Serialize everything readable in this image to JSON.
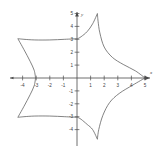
{
  "figure": {
    "title": "",
    "background_color": "#ffffff",
    "axis_color": "#4a4a4a",
    "curve_color": "#5a5a5a",
    "width": 158,
    "height": 155
  },
  "axes": {
    "x_axis_label": "x",
    "y_axis_label": "y",
    "x_ticks": [
      {
        "value": -4,
        "label": "-4"
      },
      {
        "value": -3,
        "label": "-3"
      },
      {
        "value": -2,
        "label": "-2"
      },
      {
        "value": -1,
        "label": "-1"
      },
      {
        "value": 1,
        "label": "1"
      },
      {
        "value": 2,
        "label": "2"
      },
      {
        "value": 3,
        "label": "3"
      },
      {
        "value": 4,
        "label": "4"
      },
      {
        "value": 5,
        "label": "5"
      }
    ],
    "y_ticks": [
      {
        "value": 5,
        "label": "5"
      },
      {
        "value": 4,
        "label": "4"
      },
      {
        "value": 3,
        "label": "3"
      },
      {
        "value": 2,
        "label": "2"
      },
      {
        "value": 1,
        "label": "1"
      },
      {
        "value": -1,
        "label": "-1"
      },
      {
        "value": -2,
        "label": "-2"
      },
      {
        "value": -3,
        "label": "-3"
      },
      {
        "value": -4,
        "label": "-4"
      }
    ]
  },
  "chart_data": {
    "type": "line",
    "title": "",
    "xlabel": "x",
    "ylabel": "y",
    "xlim": [
      -5.2,
      5.4
    ],
    "ylim": [
      -5.0,
      5.4
    ],
    "grid": false,
    "legend": null,
    "series": [
      {
        "name": "hypocycloid",
        "closed": true,
        "outer_cusps": [
          {
            "x": 5.0,
            "y": 0.0
          },
          {
            "x": 1.5,
            "y": 5.0
          },
          {
            "x": -4.35,
            "y": 3.05
          },
          {
            "x": -4.35,
            "y": -3.05
          },
          {
            "x": 1.5,
            "y": -4.75
          }
        ],
        "inner_cusps": [
          {
            "x": 0.05,
            "y": 3.05
          },
          {
            "x": -3.05,
            "y": 0.0
          },
          {
            "x": 0.05,
            "y": -3.05
          }
        ],
        "points": [
          {
            "x": 5.0,
            "y": 0.0
          },
          {
            "x": 4.3,
            "y": 0.55
          },
          {
            "x": 3.4,
            "y": 1.05
          },
          {
            "x": 2.6,
            "y": 1.6
          },
          {
            "x": 2.0,
            "y": 2.4
          },
          {
            "x": 1.68,
            "y": 3.5
          },
          {
            "x": 1.55,
            "y": 4.4
          },
          {
            "x": 1.5,
            "y": 5.0
          },
          {
            "x": 1.15,
            "y": 4.2
          },
          {
            "x": 0.75,
            "y": 3.6
          },
          {
            "x": 0.3,
            "y": 3.2
          },
          {
            "x": 0.05,
            "y": 3.05
          },
          {
            "x": -0.9,
            "y": 3.0
          },
          {
            "x": -2.0,
            "y": 2.95
          },
          {
            "x": -3.1,
            "y": 2.95
          },
          {
            "x": -3.9,
            "y": 3.0
          },
          {
            "x": -4.35,
            "y": 3.05
          },
          {
            "x": -3.9,
            "y": 2.2
          },
          {
            "x": -3.45,
            "y": 1.3
          },
          {
            "x": -3.15,
            "y": 0.6
          },
          {
            "x": -3.05,
            "y": 0.0
          },
          {
            "x": -3.15,
            "y": -0.6
          },
          {
            "x": -3.45,
            "y": -1.3
          },
          {
            "x": -3.9,
            "y": -2.2
          },
          {
            "x": -4.35,
            "y": -3.05
          },
          {
            "x": -3.9,
            "y": -3.0
          },
          {
            "x": -3.1,
            "y": -2.95
          },
          {
            "x": -2.0,
            "y": -2.95
          },
          {
            "x": -0.9,
            "y": -3.0
          },
          {
            "x": 0.05,
            "y": -3.05
          },
          {
            "x": 0.3,
            "y": -3.2
          },
          {
            "x": 0.75,
            "y": -3.6
          },
          {
            "x": 1.15,
            "y": -4.0
          },
          {
            "x": 1.5,
            "y": -4.75
          },
          {
            "x": 1.6,
            "y": -4.0
          },
          {
            "x": 1.9,
            "y": -2.9
          },
          {
            "x": 2.4,
            "y": -1.9
          },
          {
            "x": 3.1,
            "y": -1.2
          },
          {
            "x": 4.1,
            "y": -0.55
          },
          {
            "x": 5.0,
            "y": 0.0
          }
        ]
      }
    ]
  }
}
